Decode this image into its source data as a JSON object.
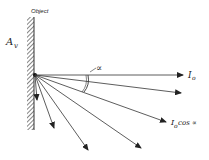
{
  "diagram": {
    "labels": {
      "object": "Object",
      "area": "A",
      "area_sub": "v",
      "angle": "∝",
      "intensity_normal": "I",
      "intensity_normal_sub": "o",
      "intensity_angle": "I",
      "intensity_angle_sub": "o",
      "intensity_angle_suffix": "cos ∝"
    },
    "colors": {
      "line": "#333333",
      "background": "#ffffff"
    },
    "origin": [
      35,
      75
    ],
    "rays": [
      {
        "to": [
          183,
          75
        ],
        "label": "I_o"
      },
      {
        "to": [
          181,
          93
        ]
      },
      {
        "to": [
          166,
          122
        ],
        "label": "I_o cos ∝"
      },
      {
        "to": [
          141,
          148
        ]
      },
      {
        "to": [
          88,
          150
        ]
      },
      {
        "to": [
          54,
          128
        ]
      },
      {
        "to": [
          37,
          100
        ]
      }
    ]
  }
}
